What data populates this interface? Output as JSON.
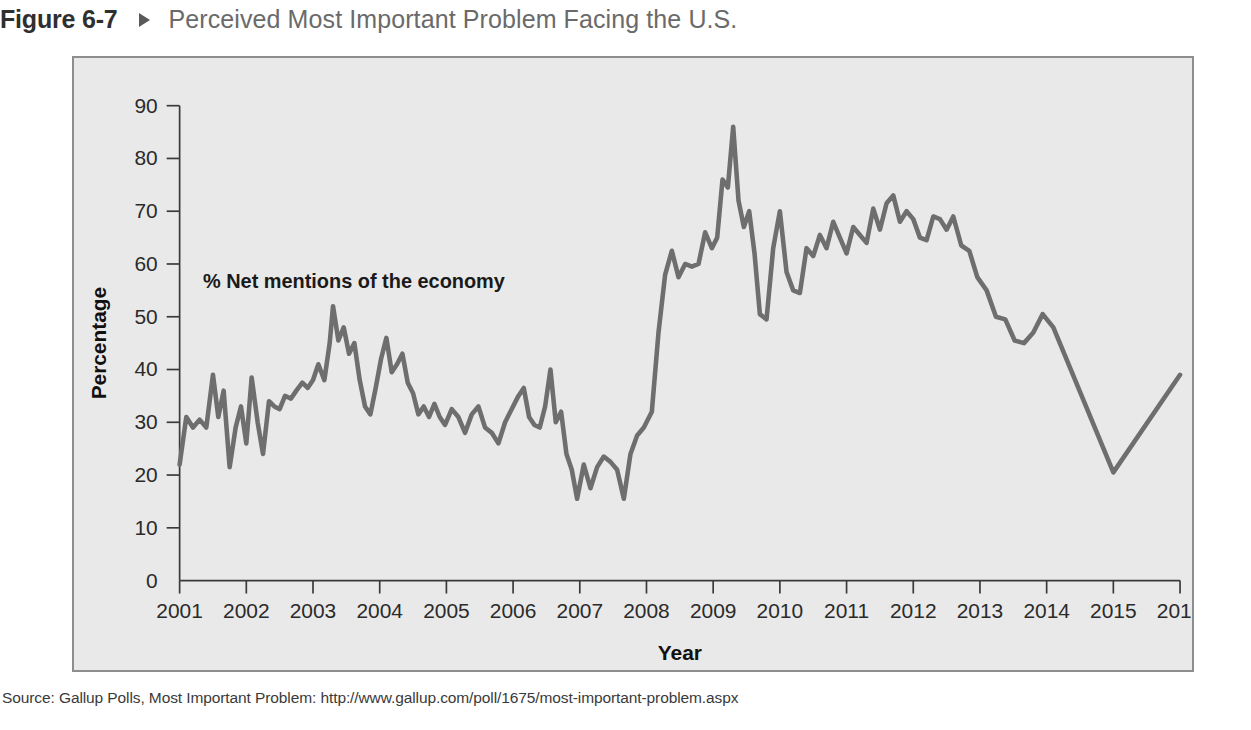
{
  "figure": {
    "number": "Figure 6-7",
    "arrow_icon": "triangle-right-icon",
    "title": "Perceived Most Important Problem Facing the U.S."
  },
  "source": {
    "text": "Source: Gallup Polls, Most Important Problem: http://www.gallup.com/poll/1675/most-important-problem.aspx"
  },
  "colors": {
    "panel_background": "#e9e9e9",
    "panel_border": "#8e8e8e",
    "line": "#6e6e6e",
    "axis": "#3a3a3a",
    "caption_number": "#2f2f2f",
    "caption_title": "#6a6a6a",
    "page_background": "#ffffff"
  },
  "chart_data": {
    "type": "line",
    "title": "Perceived Most Important Problem Facing the U.S.",
    "xlabel": "Year",
    "ylabel": "Percentage",
    "annotation": "% Net mentions of the economy",
    "grid": false,
    "legend": "none",
    "xlim": [
      2001,
      2016
    ],
    "ylim": [
      0,
      90
    ],
    "ytick_step": 10,
    "yticks": [
      0,
      10,
      20,
      30,
      40,
      50,
      60,
      70,
      80,
      90
    ],
    "xticks": [
      2001,
      2002,
      2003,
      2004,
      2005,
      2006,
      2007,
      2008,
      2009,
      2010,
      2011,
      2012,
      2013,
      2014,
      2015,
      2016
    ],
    "series": [
      {
        "name": "% Net mentions of the economy",
        "x": [
          2001.0,
          2001.1,
          2001.2,
          2001.3,
          2001.4,
          2001.5,
          2001.58,
          2001.66,
          2001.75,
          2001.84,
          2001.92,
          2002.0,
          2002.08,
          2002.17,
          2002.25,
          2002.34,
          2002.42,
          2002.5,
          2002.58,
          2002.67,
          2002.75,
          2002.84,
          2002.92,
          2003.0,
          2003.08,
          2003.17,
          2003.25,
          2003.3,
          2003.38,
          2003.46,
          2003.54,
          2003.62,
          2003.7,
          2003.78,
          2003.86,
          2003.94,
          2004.02,
          2004.1,
          2004.18,
          2004.26,
          2004.34,
          2004.42,
          2004.5,
          2004.58,
          2004.66,
          2004.74,
          2004.82,
          2004.9,
          2004.98,
          2005.08,
          2005.18,
          2005.28,
          2005.38,
          2005.48,
          2005.58,
          2005.68,
          2005.78,
          2005.88,
          2005.98,
          2006.08,
          2006.16,
          2006.24,
          2006.32,
          2006.4,
          2006.48,
          2006.56,
          2006.64,
          2006.72,
          2006.8,
          2006.88,
          2006.96,
          2007.06,
          2007.16,
          2007.26,
          2007.36,
          2007.46,
          2007.56,
          2007.66,
          2007.76,
          2007.86,
          2007.96,
          2008.08,
          2008.18,
          2008.28,
          2008.38,
          2008.48,
          2008.58,
          2008.68,
          2008.78,
          2008.88,
          2008.98,
          2009.06,
          2009.14,
          2009.22,
          2009.3,
          2009.38,
          2009.46,
          2009.54,
          2009.62,
          2009.7,
          2009.8,
          2009.9,
          2010.0,
          2010.1,
          2010.2,
          2010.3,
          2010.4,
          2010.5,
          2010.6,
          2010.7,
          2010.8,
          2010.9,
          2011.0,
          2011.1,
          2011.2,
          2011.3,
          2011.4,
          2011.5,
          2011.6,
          2011.7,
          2011.8,
          2011.9,
          2012.0,
          2012.1,
          2012.2,
          2012.3,
          2012.4,
          2012.5,
          2012.6,
          2012.72,
          2012.84,
          2012.96,
          2013.1,
          2013.24,
          2013.38,
          2013.52,
          2013.66,
          2013.8,
          2013.94,
          2014.1,
          2015.0,
          2016.0
        ],
        "y": [
          22.0,
          31.0,
          29.0,
          30.5,
          29.0,
          39.0,
          31.0,
          36.0,
          21.5,
          29.0,
          33.0,
          26.0,
          38.5,
          30.0,
          24.0,
          34.0,
          33.0,
          32.5,
          35.0,
          34.5,
          36.0,
          37.5,
          36.5,
          38.0,
          41.0,
          38.0,
          45.0,
          52.0,
          45.5,
          48.0,
          43.0,
          45.0,
          38.0,
          33.0,
          31.5,
          36.5,
          42.0,
          46.0,
          39.5,
          41.0,
          43.0,
          37.5,
          35.5,
          31.5,
          33.0,
          31.0,
          33.5,
          31.0,
          29.5,
          32.5,
          31.0,
          28.0,
          31.5,
          33.0,
          29.0,
          28.0,
          26.0,
          30.0,
          32.5,
          35.0,
          36.5,
          31.0,
          29.5,
          29.0,
          33.0,
          40.0,
          30.0,
          32.0,
          24.0,
          21.0,
          15.5,
          22.0,
          17.5,
          21.5,
          23.5,
          22.5,
          21.0,
          15.5,
          24.0,
          27.5,
          29.0,
          32.0,
          47.0,
          58.0,
          62.5,
          57.5,
          60.0,
          59.5,
          60.0,
          66.0,
          63.0,
          65.0,
          76.0,
          74.5,
          86.0,
          72.0,
          67.0,
          70.0,
          62.0,
          50.5,
          49.5,
          63.0,
          70.0,
          58.5,
          55.0,
          54.5,
          63.0,
          61.5,
          65.5,
          63.0,
          68.0,
          65.0,
          62.0,
          67.0,
          65.5,
          64.0,
          70.5,
          66.5,
          71.5,
          73.0,
          68.0,
          70.0,
          68.5,
          65.0,
          64.5,
          69.0,
          68.5,
          66.5,
          69.0,
          63.5,
          62.5,
          57.5,
          55.0,
          50.0,
          49.5,
          45.5,
          45.0,
          47.0,
          50.5,
          48.0,
          20.5,
          39.0
        ]
      }
    ]
  }
}
